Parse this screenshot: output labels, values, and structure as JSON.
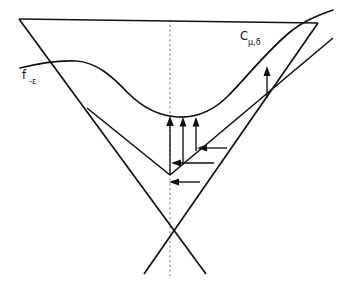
{
  "figure": {
    "background_color": "#ffffff",
    "stroke_color": "#111111",
    "dashed_axis_color": "#8d8d8d",
    "width": 350,
    "height": 286
  },
  "labels": {
    "curve_label": {
      "base": "f",
      "subscript": "-ε",
      "full": "f₋ε",
      "position": "upper-left"
    },
    "cone_label": {
      "base": "C",
      "subscript": "μ,δ",
      "full": "Cμ,δ",
      "position": "upper-right"
    }
  },
  "geometry": {
    "top_line": {
      "x1": 19,
      "y1": 19,
      "x2": 318,
      "y2": 23
    },
    "outer_cone_left_edge": {
      "x1": 19,
      "y1": 19,
      "x2": 206,
      "y2": 274
    },
    "outer_cone_right_edge": {
      "x1": 318,
      "y1": 23,
      "x2": 144,
      "y2": 274
    },
    "cone_crossing_point": {
      "x": 170,
      "y": 232
    },
    "inner_vertex": {
      "x": 170,
      "y": 175
    },
    "inner_left_edge": {
      "x1": 87,
      "y1": 108,
      "x2": 170,
      "y2": 175
    },
    "inner_right_ray": {
      "x1": 170,
      "y1": 175,
      "x2": 333,
      "y2": 38
    },
    "dashed_axis": {
      "x": 170,
      "y_top": 20,
      "y_bottom": 276
    },
    "curve_points": "M 20,68 C 40,63 58,60 76,61 C 96,62 112,76 128,93 C 143,108 158,116 178,117 C 198,118 214,110 228,96 C 246,78 266,52 290,32 C 300,24 310,18 333,10"
  },
  "arrows": {
    "vertical": [
      {
        "name": "vertical-arrow-1",
        "x": 170,
        "y_from": 175,
        "y_to": 118
      },
      {
        "name": "vertical-arrow-2",
        "x": 183,
        "y_from": 163,
        "y_to": 118
      },
      {
        "name": "vertical-arrow-3",
        "x": 196,
        "y_from": 150,
        "y_to": 118
      },
      {
        "name": "vertical-arrow-right",
        "x": 267,
        "y_from": 97,
        "y_to": 68
      }
    ],
    "horizontal": [
      {
        "name": "horizontal-arrow-1",
        "y": 148,
        "x_from": 227,
        "x_to": 198
      },
      {
        "name": "horizontal-arrow-2",
        "y": 163,
        "x_from": 214,
        "x_to": 172
      },
      {
        "name": "horizontal-arrow-3",
        "y": 182,
        "x_from": 200,
        "x_to": 170
      }
    ]
  }
}
